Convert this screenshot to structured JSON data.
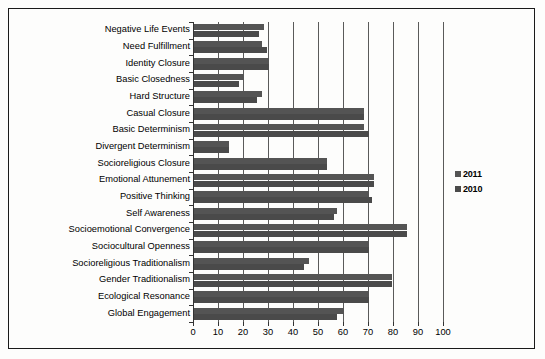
{
  "chart_data": {
    "type": "bar",
    "orientation": "horizontal",
    "title": "",
    "xlabel": "",
    "ylabel": "",
    "xlim": [
      0,
      100
    ],
    "xticks": [
      0,
      10,
      20,
      30,
      40,
      50,
      60,
      70,
      80,
      90,
      100
    ],
    "grid": true,
    "legend_position": "right",
    "categories": [
      "Negative Life Events",
      "Need Fulfillment",
      "Identity Closure",
      "Basic Closedness",
      "Hard Structure",
      "Casual Closure",
      "Basic Determinism",
      "Divergent Determinism",
      "Socioreligious Closure",
      "Emotional Attunement",
      "Positive Thinking",
      "Self Awareness",
      "Socioemotional Convergence",
      "Sociocultural Openness",
      "Socioreligious Traditionalism",
      "Gender Traditionalism",
      "Ecological Resonance",
      "Global Engagement"
    ],
    "series": [
      {
        "name": "2011",
        "color": "#545454",
        "values": [
          28,
          27,
          30,
          20,
          27,
          68,
          68,
          14,
          53,
          72,
          70,
          57,
          85,
          70,
          46,
          79,
          70,
          60
        ]
      },
      {
        "name": "2010",
        "color": "#4a4a4a",
        "values": [
          26,
          29,
          30,
          18,
          25,
          68,
          70,
          14,
          53,
          72,
          71,
          56,
          85,
          70,
          44,
          79,
          70,
          57
        ]
      }
    ]
  },
  "legend": {
    "items": [
      {
        "label": "2011",
        "color": "#545454"
      },
      {
        "label": "2010",
        "color": "#4a4a4a"
      }
    ]
  },
  "axis": {
    "tick_labels": [
      "0",
      "10",
      "20",
      "30",
      "40",
      "50",
      "60",
      "70",
      "80",
      "90",
      "100"
    ]
  }
}
